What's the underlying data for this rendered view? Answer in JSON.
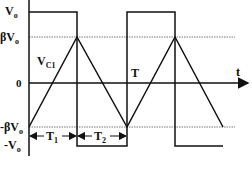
{
  "labels": {
    "vo": "V",
    "vo_sub": "o",
    "beta_vo": "βV",
    "beta_vo_sub": "o",
    "zero": "0",
    "neg_beta_vo": "-βV",
    "neg_beta_vo_sub": "o",
    "neg_vo": "-V",
    "neg_vo_sub": "o",
    "vc1": "V",
    "vc1_sub": "C1",
    "period": "T",
    "time_axis": "t",
    "t1": "T",
    "t1_sub": "1",
    "t2": "T",
    "t2_sub": "2"
  },
  "colors": {
    "stroke": "#111111",
    "dotted": "#666666",
    "background": "#ffffff"
  },
  "levels_y": {
    "vo": 12,
    "beta_vo": 37,
    "zero": 83,
    "neg_beta_vo": 127,
    "neg_vo": 146
  }
}
